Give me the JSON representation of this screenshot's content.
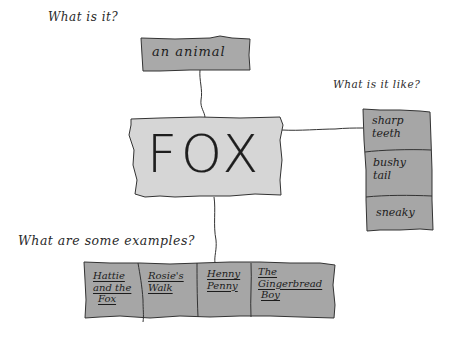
{
  "diagram": {
    "type": "concept-map",
    "style": "hand-drawn",
    "colors": {
      "center_fill": "#d6d6d6",
      "branch_fill": "#a6a6a6",
      "ink": "#222222",
      "background": "#ffffff"
    },
    "center": {
      "label": "FOX"
    },
    "branches": {
      "top": {
        "question": "What is it?",
        "items": [
          "an animal"
        ]
      },
      "right": {
        "question": "What is it like?",
        "items": [
          "sharp teeth",
          "bushy tail",
          "sneaky"
        ]
      },
      "bottom": {
        "question": "What are some examples?",
        "items": [
          "Hattie and the Fox",
          "Rosie's Walk",
          "Henny Penny",
          "The Gingerbread Boy"
        ]
      }
    },
    "right_items_lines": [
      [
        "sharp",
        "teeth"
      ],
      [
        "bushy",
        "tail"
      ],
      [
        "sneaky"
      ]
    ],
    "bottom_items_lines": [
      [
        "Hattie",
        "and the",
        "Fox"
      ],
      [
        "Rosie's",
        "Walk"
      ],
      [
        "Henny",
        "Penny"
      ],
      [
        "The",
        "Gingerbread",
        "Boy"
      ]
    ]
  }
}
